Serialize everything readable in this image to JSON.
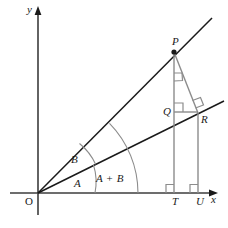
{
  "figure": {
    "type": "geometry-diagram",
    "background_color": "#ffffff",
    "axis_color": "#3d3d3d",
    "ray_color": "#1a1a1a",
    "construction_color": "#8c8c8c",
    "arc_color": "#8c8c8c",
    "label_color": "#1a1a1a"
  },
  "axes": {
    "x_label": "x",
    "y_label": "y",
    "origin_label": "O"
  },
  "points": [
    {
      "id": "P",
      "label": "P",
      "x": 174,
      "y": 52
    },
    {
      "id": "Q",
      "label": "Q",
      "x": 174,
      "y": 112
    },
    {
      "id": "R",
      "label": "R",
      "x": 198,
      "y": 113
    },
    {
      "id": "T",
      "label": "T",
      "x": 174,
      "y": 193
    },
    {
      "id": "U",
      "label": "U",
      "x": 198,
      "y": 193
    }
  ],
  "angles": [
    {
      "id": "A",
      "label": "A",
      "description": "angle between x-axis and lower ray OR"
    },
    {
      "id": "B",
      "label": "B",
      "description": "angle between lower ray OR and upper ray OP"
    },
    {
      "id": "A+B",
      "label": "A + B",
      "description": "total angle between x-axis and upper ray OP"
    }
  ],
  "right_angles": [
    {
      "at": "P",
      "description": "right angle at P between PT and PR"
    },
    {
      "at": "Q",
      "description": "right angle at Q between QT and QR"
    },
    {
      "at": "R",
      "description": "right angle at R between OR and RP"
    },
    {
      "at": "T",
      "description": "right angle at T between x-axis and PT"
    },
    {
      "at": "U",
      "description": "right angle at U between x-axis and RU"
    }
  ]
}
